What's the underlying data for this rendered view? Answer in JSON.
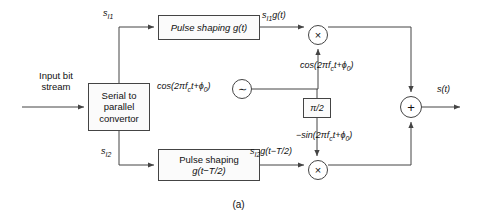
{
  "figure": {
    "caption": "(a)",
    "type": "offset-qpsk-modulator-block-diagram"
  },
  "blocks": {
    "serial_to_parallel": {
      "line1": "Serial to",
      "line2": "parallel",
      "line3": "convertor"
    },
    "pulse_shaping_top": {
      "line1": "Pulse shaping g(t)"
    },
    "pulse_shaping_bottom": {
      "line1": "Pulse shaping",
      "line2": "g(t−T/2)"
    },
    "phase_shifter": {
      "label": "π/2"
    }
  },
  "operators": {
    "multiplier_top": "×",
    "multiplier_bottom": "×",
    "adder": "+",
    "oscillator": "∼"
  },
  "signals": {
    "input": {
      "line1": "Input bit",
      "line2": "stream"
    },
    "branch_i": "s",
    "branch_i_sub": "I1",
    "branch_q": "s",
    "branch_q_sub": "I2",
    "shaped_i_pre": "s",
    "shaped_i_sub": "I1",
    "shaped_i_post": "g(t)",
    "shaped_q_pre": "s",
    "shaped_q_sub": "I2",
    "shaped_q_post": "g(t−T/2)",
    "carrier_osc": "cos(2πf",
    "carrier_osc_sub": "c",
    "carrier_osc_post": "t+ϕ",
    "carrier_osc_sub2": "0",
    "carrier_osc_end": ")",
    "carrier_inphase": "cos(2πf",
    "carrier_inphase_sub": "c",
    "carrier_inphase_post": "t+ϕ",
    "carrier_inphase_sub2": "0",
    "carrier_inphase_end": ")",
    "carrier_quad": "−sin(2πf",
    "carrier_quad_sub": "c",
    "carrier_quad_post": "t+ϕ",
    "carrier_quad_sub2": "0",
    "carrier_quad_end": ")",
    "output": "s(t)"
  },
  "colors": {
    "line": "#444444",
    "text": "#111111",
    "box_fill": "#fbfbfb",
    "background": "#ffffff"
  }
}
